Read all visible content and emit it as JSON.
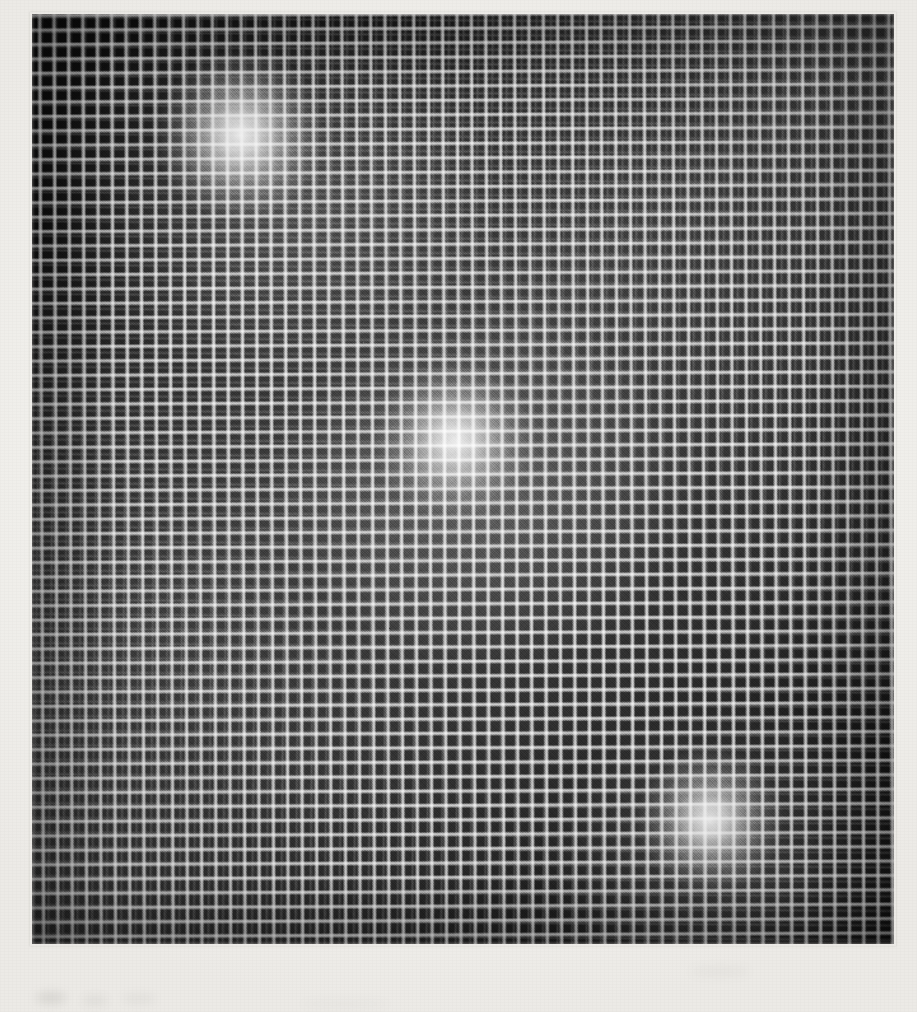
{
  "document": {
    "kind": "scanned-photograph",
    "caption": "",
    "page_background_color": "#f3f2ef",
    "canvas_width": 917,
    "canvas_height": 1012
  },
  "photo": {
    "name": "grid-mesh-photograph",
    "left": 32,
    "top": 14,
    "width": 862,
    "height": 930,
    "subject": "regular square wire-mesh / grid screen backlit by three diffuse light sources",
    "base_color": "#141414",
    "cell_dark_color": "#0d0d0d",
    "thread_light_color": "#e2e2e2",
    "grid_pitch_px": 14.4,
    "approx_columns": 60,
    "approx_rows": 64,
    "rotation_deg": -0.25
  },
  "glows": [
    {
      "name": "glow-top-left",
      "center_x": 240,
      "center_y": 135,
      "radius": 86,
      "peak_intensity": 0.95,
      "core_color": "#ffffff"
    },
    {
      "name": "glow-center",
      "center_x": 455,
      "center_y": 440,
      "radius": 80,
      "peak_intensity": 0.88,
      "core_color": "#ffffff"
    },
    {
      "name": "glow-bottom-right",
      "center_x": 710,
      "center_y": 820,
      "radius": 74,
      "peak_intensity": 0.92,
      "core_color": "#ffffff"
    }
  ],
  "haze_band": {
    "name": "diagonal-haze",
    "angle_deg": 142,
    "peak_intensity": 0.17,
    "description": "faint luminous band running from upper-left through centre to lower-right, linking the three glows"
  },
  "margin_marks": [
    {
      "name": "smudge-1",
      "left": 36,
      "top": 992,
      "width": 30,
      "height": 12
    },
    {
      "name": "smudge-2",
      "left": 82,
      "top": 996,
      "width": 26,
      "height": 9
    },
    {
      "name": "smudge-3",
      "left": 122,
      "top": 994,
      "width": 34,
      "height": 10
    },
    {
      "name": "smudge-4",
      "left": 690,
      "top": 966,
      "width": 60,
      "height": 11
    },
    {
      "name": "smudge-5",
      "left": 300,
      "top": 1000,
      "width": 90,
      "height": 8
    }
  ]
}
